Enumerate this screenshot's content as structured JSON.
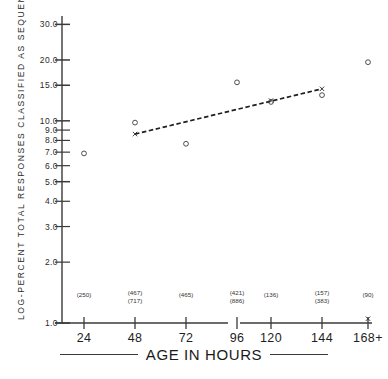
{
  "chart_data": {
    "type": "scatter",
    "title": "",
    "xlabel": "AGE IN HOURS",
    "ylabel": "LOG-PERCENT TOTAL RESPONSES CLASSIFIED AS SEQUENTIAL",
    "yscale": "log",
    "ylim": [
      1.0,
      33.0
    ],
    "grid": false,
    "legend": "none",
    "x_categories": [
      "24",
      "48",
      "72",
      "96",
      "120",
      "144",
      "168+"
    ],
    "x_axis_break_after": "96",
    "y_ticks": [
      "30.0",
      "20.0",
      "15.0",
      "10.0",
      "9.0",
      "8.0",
      "7.0",
      "6.0",
      "5.0",
      "4.0",
      "3.0",
      "2.0",
      "1.0"
    ],
    "sample_sizes": [
      {
        "category": "24",
        "lines": [
          "(250)"
        ]
      },
      {
        "category": "48",
        "lines": [
          "(467)",
          "(717)"
        ]
      },
      {
        "category": "72",
        "lines": [
          "(465)"
        ]
      },
      {
        "category": "96",
        "lines": [
          "(421)",
          "(886)"
        ]
      },
      {
        "category": "120",
        "lines": [
          "(136)"
        ]
      },
      {
        "category": "144",
        "lines": [
          "(157)",
          "(383)"
        ]
      },
      {
        "category": "168+",
        "lines": [
          "(90)"
        ]
      }
    ],
    "series": [
      {
        "name": "observed-open-circle",
        "marker": "circle",
        "points": [
          {
            "x": "24",
            "y": 6.9
          },
          {
            "x": "48",
            "y": 9.8
          },
          {
            "x": "72",
            "y": 7.7
          },
          {
            "x": "96",
            "y": 15.5
          },
          {
            "x": "120",
            "y": 12.4
          },
          {
            "x": "144",
            "y": 13.4
          },
          {
            "x": "168+",
            "y": 19.5
          }
        ]
      },
      {
        "name": "fitted-x-marker",
        "marker": "x",
        "points": [
          {
            "x": "48",
            "y": 8.6
          },
          {
            "x": "120",
            "y": 12.6
          },
          {
            "x": "144",
            "y": 14.4
          },
          {
            "x": "168+",
            "y": 1.05
          }
        ]
      }
    ],
    "trend_line": {
      "name": "regression-trend",
      "style": "dashed",
      "from": {
        "x": "48",
        "y": 8.6
      },
      "to": {
        "x": "144",
        "y": 14.4
      }
    }
  },
  "axis_title": {
    "x": "AGE IN HOURS"
  }
}
